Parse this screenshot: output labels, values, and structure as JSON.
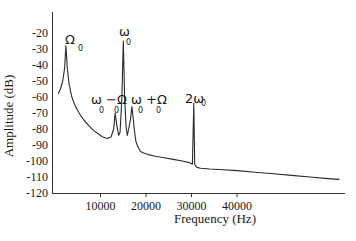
{
  "chart_data": {
    "type": "line",
    "title": "",
    "xlabel": "Frequency (Hz)",
    "ylabel": "Amplitude (dB)",
    "xlim": [
      0,
      64000
    ],
    "ylim": [
      -120,
      -10
    ],
    "x_ticks": [
      10000,
      20000,
      30000,
      40000
    ],
    "x_tick_labels": [
      "10000",
      "20000",
      "30000",
      "40000"
    ],
    "y_ticks": [
      -20,
      -30,
      -40,
      -50,
      -60,
      -70,
      -80,
      -90,
      -100,
      -110,
      -120
    ],
    "y_tick_labels": [
      "-20",
      "-30",
      "-40",
      "-50",
      "-60",
      "-70",
      "-80",
      "-90",
      "-100",
      "-110",
      "-120"
    ],
    "grid": false,
    "legend": null,
    "series": [
      {
        "name": "spectrum",
        "x": [
          700,
          1200,
          1700,
          2100,
          2400,
          2700,
          3100,
          3700,
          4500,
          5500,
          6500,
          7500,
          8500,
          9500,
          10500,
          11500,
          12300,
          12900,
          13200,
          13600,
          14000,
          14300,
          14700,
          15000,
          15300,
          15600,
          15900,
          16200,
          16600,
          16900,
          17200,
          17500,
          17800,
          18200,
          18800,
          19500,
          20500,
          22000,
          24000,
          26000,
          28000,
          29500,
          30200,
          30500,
          30700,
          30900,
          31200,
          32000,
          34000,
          37000,
          40000,
          44000,
          48000,
          52000,
          56000,
          60000,
          62500
        ],
        "y": [
          -58,
          -55,
          -50,
          -42,
          -28,
          -42,
          -52,
          -60,
          -66,
          -71,
          -75,
          -78,
          -81,
          -83,
          -85,
          -86,
          -85,
          -80,
          -70,
          -78,
          -84,
          -82,
          -60,
          -25,
          -60,
          -78,
          -84,
          -80,
          -74,
          -66,
          -74,
          -82,
          -88,
          -91,
          -94,
          -95,
          -96,
          -97,
          -98,
          -99,
          -100,
          -101,
          -102,
          -64,
          -102,
          -103,
          -104,
          -104.5,
          -105,
          -105.5,
          -106,
          -107,
          -108,
          -109,
          -110,
          -111,
          -111.5
        ]
      }
    ],
    "annotations": [
      {
        "label": "Ω",
        "sub": "0",
        "x": 2400,
        "y": -28
      },
      {
        "label": "ω",
        "sub": "0",
        "x": 15000,
        "y": -25
      },
      {
        "label": "ω −Ω",
        "sub": "0  0",
        "x": 13600,
        "y": -70
      },
      {
        "label": "ω +Ω",
        "sub": "0  0",
        "x": 16900,
        "y": -66
      },
      {
        "label": "2ω",
        "sub": "0",
        "x": 30500,
        "y": -64
      }
    ]
  },
  "axes": {
    "xlabel": "Frequency (Hz)",
    "ylabel": "Amplitude (dB)"
  },
  "peaks": {
    "omega_cap": {
      "main": "Ω",
      "sub": "0"
    },
    "omega": {
      "main": "ω",
      "sub": "0"
    },
    "minus": {
      "main": "ω −Ω",
      "sub1": "0",
      "sub2": "0"
    },
    "plus": {
      "main": "ω +Ω",
      "sub1": "0",
      "sub2": "0"
    },
    "double": {
      "main": "2ω",
      "sub": "0"
    }
  }
}
